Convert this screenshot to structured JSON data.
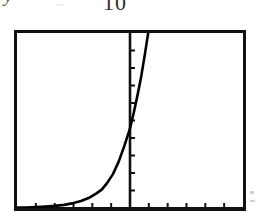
{
  "figure": {
    "equation": {
      "variable": "y",
      "equals": "=",
      "dash": "-",
      "base": "10",
      "full_text": "y = 10"
    }
  },
  "colors": {
    "ink": "#111111",
    "curve": "#000000",
    "background": "#ffffff",
    "artifact": "#9a9a9a"
  },
  "chart_data": {
    "type": "line",
    "xlabel": "",
    "ylabel": "",
    "xlim": [
      -6,
      6
    ],
    "ylim": [
      0,
      10
    ],
    "grid": false,
    "legend": false,
    "axes_style": "graphing-calculator",
    "x_axis_position_y": 0,
    "y_axis_position_x": 0,
    "xticks": [
      -5,
      -4,
      -3,
      -2,
      -1,
      1,
      2,
      3,
      4,
      5
    ],
    "yticks": [
      1,
      2,
      3,
      4,
      5,
      6,
      7,
      8,
      9
    ],
    "tick_labels_shown": false,
    "series": [
      {
        "name": "y = 10^x",
        "x": [
          -6.0,
          -5.5,
          -5.0,
          -4.5,
          -4.0,
          -3.5,
          -3.0,
          -2.6,
          -2.2,
          -1.8,
          -1.5,
          -1.2,
          -0.9,
          -0.6,
          -0.3,
          0.0,
          0.2,
          0.4,
          0.6,
          0.8,
          0.9,
          1.0
        ],
        "y": [
          0.02,
          0.03,
          0.05,
          0.08,
          0.12,
          0.18,
          0.28,
          0.4,
          0.57,
          0.82,
          1.05,
          1.45,
          1.95,
          2.65,
          3.55,
          4.55,
          5.45,
          6.45,
          7.55,
          8.85,
          9.55,
          10.2
        ]
      }
    ],
    "annotations": [
      {
        "text": "curve is asymptotic to the x-axis on the left and rises steeply to exit the top of the frame"
      }
    ]
  }
}
